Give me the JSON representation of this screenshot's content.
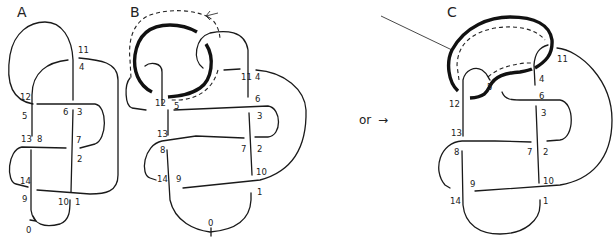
{
  "figure": {
    "panels": [
      {
        "id": "A",
        "title": "A",
        "labels": [
          "0",
          "1",
          "2",
          "3",
          "4",
          "5",
          "6",
          "7",
          "8",
          "9",
          "10",
          "11",
          "12",
          "13",
          "14"
        ]
      },
      {
        "id": "B",
        "title": "B",
        "labels": [
          "0",
          "1",
          "2",
          "3",
          "4",
          "5",
          "6",
          "7",
          "8",
          "9",
          "10",
          "11",
          "12",
          "13",
          "14"
        ]
      },
      {
        "id": "C",
        "title": "C",
        "labels": [
          "1",
          "2",
          "3",
          "4",
          "5",
          "6",
          "7",
          "8",
          "9",
          "10",
          "11",
          "12",
          "13",
          "14"
        ]
      }
    ],
    "connector_text": "or",
    "connector_arrow": "→",
    "colors": {
      "ink": "#1a1a1a",
      "background": "#ffffff"
    }
  },
  "A": {
    "title": "A",
    "l0": "0",
    "l1": "1",
    "l2": "2",
    "l3": "3",
    "l4": "4",
    "l5": "5",
    "l6": "6",
    "l7": "7",
    "l8": "8",
    "l9": "9",
    "l10": "10",
    "l11": "11",
    "l12": "12",
    "l13": "13",
    "l14": "14"
  },
  "B": {
    "title": "B",
    "l0": "0",
    "l1": "1",
    "l2": "2",
    "l3": "3",
    "l4": "4",
    "l5": "5",
    "l6": "6",
    "l7": "7",
    "l8": "8",
    "l9": "9",
    "l10": "10",
    "l11": "11",
    "l12": "12",
    "l13": "13",
    "l14": "14"
  },
  "C": {
    "title": "C",
    "l1": "1",
    "l2": "2",
    "l3": "3",
    "l4": "4",
    "l5": "5",
    "l6": "6",
    "l7": "7",
    "l8": "8",
    "l9": "9",
    "l10": "10",
    "l11": "11",
    "l12": "12",
    "l13": "13",
    "l14": "14"
  },
  "connector": {
    "text": "or",
    "arrow": "→"
  }
}
